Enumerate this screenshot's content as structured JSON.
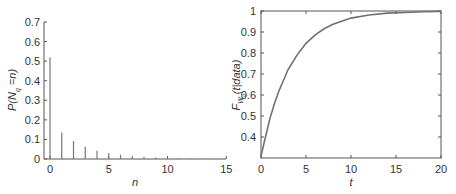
{
  "chart_data": [
    {
      "type": "bar",
      "title": "",
      "xlabel": "n",
      "ylabel": "P(N_q = n)",
      "ylabel_parts": {
        "main": "P(N",
        "sub": "q",
        "rest": " =n)"
      },
      "categories": [
        0,
        1,
        2,
        3,
        4,
        5,
        6,
        7,
        8,
        9,
        10,
        11,
        12,
        13,
        14
      ],
      "values": [
        0.52,
        0.136,
        0.092,
        0.063,
        0.042,
        0.031,
        0.022,
        0.015,
        0.011,
        0.008,
        0.006,
        0.004,
        0.003,
        0.002,
        0.001
      ],
      "xlim": [
        -0.5,
        15
      ],
      "ylim": [
        0,
        0.7
      ],
      "xticks": [
        "0",
        "5",
        "10",
        "15"
      ],
      "yticks": [
        "0",
        "0.1",
        "0.2",
        "0.3",
        "0.4",
        "0.5",
        "0.6",
        "0.7"
      ],
      "grid": false,
      "box": false
    },
    {
      "type": "line",
      "title": "",
      "xlabel": "t",
      "ylabel": "F_{W_q}(t|data)",
      "ylabel_parts": {
        "main": "F",
        "sub": "W",
        "subsub": "q",
        "rest": "(t|data)"
      },
      "x": [
        0,
        0.5,
        1,
        1.5,
        2,
        3,
        4,
        5,
        6,
        7,
        8,
        10,
        12,
        14,
        16,
        18,
        20
      ],
      "series": [
        {
          "name": "F_Wq",
          "values": [
            0.31,
            0.4,
            0.49,
            0.56,
            0.62,
            0.72,
            0.79,
            0.846,
            0.885,
            0.915,
            0.937,
            0.966,
            0.981,
            0.99,
            0.993,
            0.996,
            0.998
          ]
        }
      ],
      "xlim": [
        0,
        20
      ],
      "ylim": [
        0.3,
        1
      ],
      "xticks": [
        "0",
        "5",
        "10",
        "15",
        "20"
      ],
      "yticks": [
        "0.4",
        "0.5",
        "0.6",
        "0.7",
        "0.8",
        "0.9",
        "1"
      ],
      "grid": false,
      "box": true
    }
  ],
  "colors": {
    "line": "#707070",
    "axis": "#555555",
    "text": "#333333"
  }
}
